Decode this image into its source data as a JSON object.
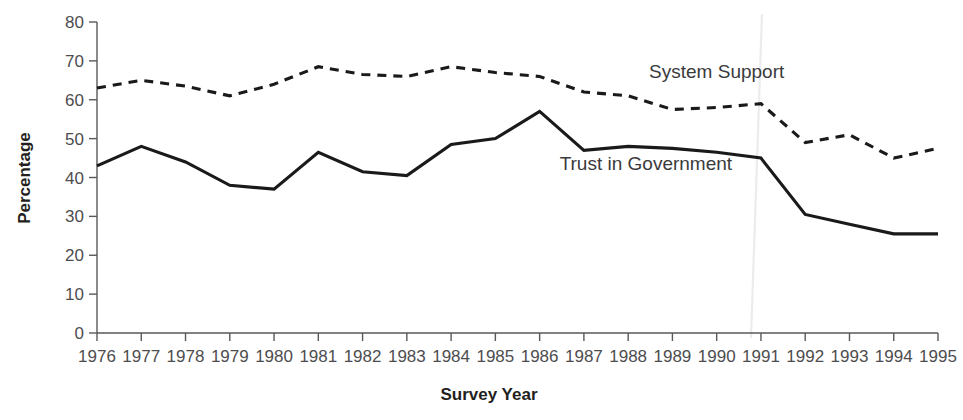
{
  "chart_data": {
    "type": "line",
    "title": "",
    "xlabel": "Survey Year",
    "ylabel": "Percentage",
    "categories": [
      "1976",
      "1977",
      "1978",
      "1979",
      "1980",
      "1981",
      "1982",
      "1983",
      "1984",
      "1985",
      "1986",
      "1987",
      "1988",
      "1989",
      "1990",
      "1991",
      "1992",
      "1993",
      "1994",
      "1995"
    ],
    "x": [
      1976,
      1977,
      1978,
      1979,
      1980,
      1981,
      1982,
      1983,
      1984,
      1985,
      1986,
      1987,
      1988,
      1989,
      1990,
      1991,
      1992,
      1993,
      1994,
      1995
    ],
    "ylim": [
      0,
      80
    ],
    "yticks": [
      0,
      10,
      20,
      30,
      40,
      50,
      60,
      70,
      80
    ],
    "ytick_labels": [
      "0",
      "10",
      "20",
      "30",
      "40",
      "50",
      "60",
      "70",
      "80"
    ],
    "grid": false,
    "legend_position": "inline-annotation",
    "series": [
      {
        "name": "System Support",
        "style": "dashed",
        "values": [
          63,
          65,
          63.5,
          61,
          64,
          68.5,
          66.5,
          66,
          68.5,
          67,
          66,
          62,
          61,
          57.5,
          58,
          59,
          49,
          51,
          45,
          47.5
        ]
      },
      {
        "name": "Trust in Government",
        "style": "solid",
        "values": [
          43,
          48,
          44,
          38,
          37,
          46.5,
          41.5,
          40.5,
          48.5,
          50,
          57,
          47,
          48,
          47.5,
          46.5,
          45,
          30.5,
          28,
          25.5,
          25.5
        ]
      }
    ],
    "annotations": [
      {
        "text": "System Support",
        "x": 1990.0,
        "y": 65.5
      },
      {
        "text": "Trust in Government",
        "x": 1988.4,
        "y": 42.0
      }
    ]
  }
}
